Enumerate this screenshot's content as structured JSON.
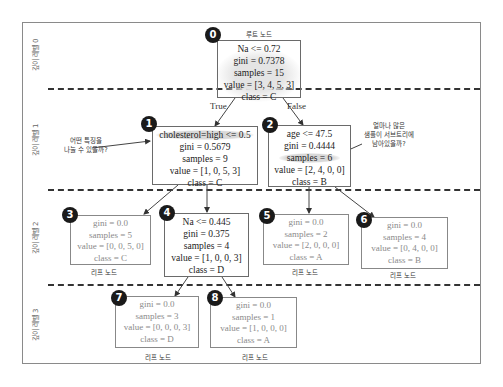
{
  "depth_labels": [
    "깊이 레벨 0",
    "깊이 레벨 1",
    "깊이 레벨 2",
    "깊이 레벨 3"
  ],
  "root_caption": "루트 노드",
  "leaf_caption": "리프 노드",
  "edge_labels": {
    "true": "True",
    "false": "False"
  },
  "annotations": {
    "split_question": [
      "어떤 특징을",
      "나눌 수 있을까?"
    ],
    "samples_question": [
      "얼마나 많은",
      "샘플이 서브트리에",
      "남아있을까?"
    ]
  },
  "nodes": [
    {
      "id": "0",
      "type": "internal",
      "lines": [
        "Na <= 0.72",
        "gini = 0.7378",
        "samples = 15",
        "value = [3, 4, 5, 3]",
        "class = C"
      ]
    },
    {
      "id": "1",
      "type": "internal",
      "lines": [
        "cholesterol=high <= 0.5",
        "gini = 0.5679",
        "samples = 9",
        "value = [1, 0, 5, 3]",
        "class = C"
      ]
    },
    {
      "id": "2",
      "type": "internal",
      "lines": [
        "age <= 47.5",
        "gini = 0.4444",
        "samples = 6",
        "value = [2, 4, 0, 0]",
        "class = B"
      ]
    },
    {
      "id": "3",
      "type": "leaf",
      "lines": [
        "gini = 0.0",
        "samples = 5",
        "value = [0, 0, 5, 0]",
        "class = C"
      ]
    },
    {
      "id": "4",
      "type": "internal",
      "lines": [
        "Na <= 0.445",
        "gini = 0.375",
        "samples = 4",
        "value = [1, 0, 0, 3]",
        "class = D"
      ]
    },
    {
      "id": "5",
      "type": "leaf",
      "lines": [
        "gini = 0.0",
        "samples = 2",
        "value = [2, 0, 0, 0]",
        "class = A"
      ]
    },
    {
      "id": "6",
      "type": "leaf",
      "lines": [
        "gini = 0.0",
        "samples = 4",
        "value = [0, 4, 0, 0]",
        "class = B"
      ]
    },
    {
      "id": "7",
      "type": "leaf",
      "lines": [
        "gini = 0.0",
        "samples = 3",
        "value = [0, 0, 0, 3]",
        "class = D"
      ]
    },
    {
      "id": "8",
      "type": "leaf",
      "lines": [
        "gini = 0.0",
        "samples = 1",
        "value = [1, 0, 0, 0]",
        "class = A"
      ]
    }
  ]
}
